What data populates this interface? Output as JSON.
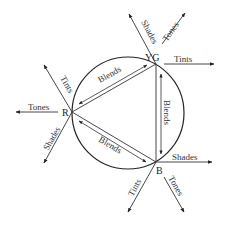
{
  "diagram": {
    "colors": {
      "stroke": "#222222",
      "text": "#333333",
      "background": "#ffffff"
    },
    "circle": {
      "cx": 128,
      "cy": 113,
      "r": 56
    },
    "vertices": [
      {
        "id": "R",
        "label": "R",
        "x": 72,
        "y": 112
      },
      {
        "id": "YG",
        "label": "YG",
        "x": 156,
        "y": 64
      },
      {
        "id": "B",
        "label": "B",
        "x": 156,
        "y": 162
      }
    ],
    "blends": [
      {
        "from": "R",
        "to": "YG",
        "label": "Blends"
      },
      {
        "from": "YG",
        "to": "B",
        "label": "Blends"
      },
      {
        "from": "R",
        "to": "B",
        "label": "Blends"
      }
    ],
    "rays": {
      "YG": [
        {
          "label": "Shades"
        },
        {
          "label": "Tones"
        },
        {
          "label": "Tints"
        }
      ],
      "R": [
        {
          "label": "Tints"
        },
        {
          "label": "Tones"
        },
        {
          "label": "Shades"
        }
      ],
      "B": [
        {
          "label": "Shades"
        },
        {
          "label": "Tints"
        },
        {
          "label": "Tones"
        }
      ]
    }
  }
}
